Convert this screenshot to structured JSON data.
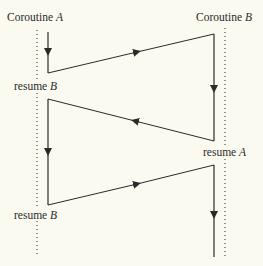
{
  "diagram": {
    "type": "coroutine-control-flow",
    "colors": {
      "background": "#fbfaf0",
      "line": "#2a2a2a"
    },
    "headers": [
      {
        "id": "A",
        "prefix": "Coroutine ",
        "name": "A"
      },
      {
        "id": "B",
        "prefix": "Coroutine ",
        "name": "B"
      }
    ],
    "labels": [
      {
        "prefix": "resume ",
        "target": "B",
        "side": "A"
      },
      {
        "prefix": "resume ",
        "target": "A",
        "side": "B"
      },
      {
        "prefix": "resume ",
        "target": "B",
        "side": "A"
      }
    ],
    "transfers": [
      {
        "from": "A",
        "to": "B"
      },
      {
        "from": "B",
        "to": "A"
      },
      {
        "from": "A",
        "to": "B"
      }
    ]
  }
}
